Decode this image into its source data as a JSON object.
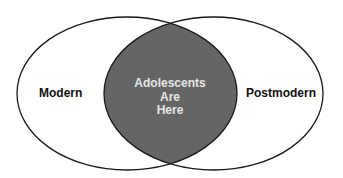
{
  "diagram": {
    "type": "venn",
    "sets": [
      {
        "label": "Modern"
      },
      {
        "label": "Postmodern"
      }
    ],
    "intersection": {
      "lines": [
        "Adolescents",
        "Are",
        "Here"
      ]
    },
    "colors": {
      "outline": "#1a1a1a",
      "intersection_fill": "#656565",
      "intersection_text": "#e6e6e6",
      "set_text": "#111111",
      "background": "#ffffff"
    }
  }
}
